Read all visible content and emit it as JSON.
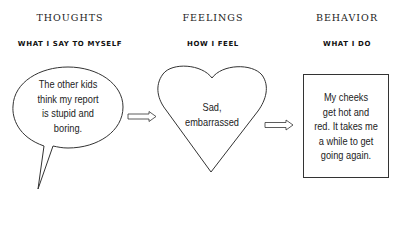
{
  "columns": [
    {
      "title": "THOUGHTS",
      "subtitle": "WHAT I SAY TO MYSELF",
      "shape": "speech-bubble",
      "text_lines": [
        "The other kids",
        "think my report",
        "is stupid and",
        "boring."
      ]
    },
    {
      "title": "FEELINGS",
      "subtitle": "HOW I FEEL",
      "shape": "heart",
      "text_lines": [
        "Sad,",
        "embarrassed"
      ]
    },
    {
      "title": "BEHAVIOR",
      "subtitle": "WHAT I DO",
      "shape": "rectangle",
      "text_lines": [
        "My cheeks",
        "get hot and",
        "red. It takes me",
        "a while to get",
        "going again."
      ]
    }
  ],
  "arrows": [
    {
      "from": "thoughts",
      "to": "feelings"
    },
    {
      "from": "feelings",
      "to": "behavior"
    }
  ],
  "colors": {
    "stroke": "#333333",
    "text": "#222222",
    "background": "#ffffff"
  }
}
